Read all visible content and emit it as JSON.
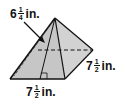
{
  "figure": {
    "shape": "square pyramid",
    "fill_color": "#c8c8c8",
    "line_color": "#111111",
    "vertices": {
      "apex": [
        55,
        18
      ],
      "front_left": [
        10,
        79
      ],
      "front_right": [
        65,
        79
      ],
      "back_right": [
        93,
        50
      ],
      "back_left": [
        38,
        50
      ],
      "front_mid": [
        40,
        79
      ]
    }
  },
  "labels": {
    "slant_height": {
      "whole": "6",
      "num": "1",
      "den": "4",
      "unit": "in."
    },
    "base_side_right": {
      "whole": "7",
      "num": "1",
      "den": "2",
      "unit": "in."
    },
    "base_side_bottom": {
      "whole": "7",
      "num": "1",
      "den": "2",
      "unit": "in."
    }
  }
}
